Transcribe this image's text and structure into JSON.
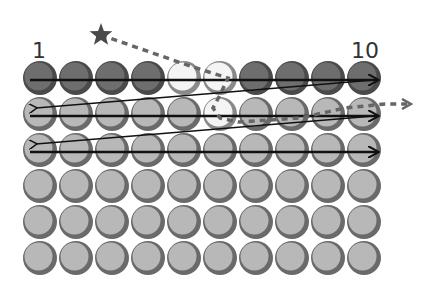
{
  "diagram": {
    "labels": {
      "start": "1",
      "end": "10"
    },
    "grid": {
      "rows": 6,
      "cols": 10,
      "origin_x": 40,
      "origin_y": 78,
      "pitch_x": 36,
      "pitch_y": 36,
      "radius": 17
    },
    "colors": {
      "dark": "#6e6e6e",
      "dark_edge": "#4a4a4a",
      "light": "#b8b8b8",
      "light_edge": "#6a6a6a",
      "white": "#f4f4f4",
      "white_edge": "#8a8a8a",
      "arrow": "#111111",
      "dashed": "#666666",
      "star": "#4a4a4a"
    },
    "row_styles": [
      "dark",
      "light",
      "light",
      "light",
      "light",
      "light"
    ],
    "highlighted_cells": [
      {
        "row": 0,
        "col": 4,
        "style": "white"
      },
      {
        "row": 0,
        "col": 5,
        "style": "white"
      },
      {
        "row": 1,
        "col": 5,
        "style": "white"
      }
    ],
    "scan_arrows": [
      {
        "type": "forward",
        "row": 0
      },
      {
        "type": "return",
        "from_row": 0,
        "to_row": 1
      },
      {
        "type": "forward",
        "row": 1
      },
      {
        "type": "return",
        "from_row": 1,
        "to_row": 2
      },
      {
        "type": "forward",
        "row": 2
      }
    ],
    "star": {
      "x": 101,
      "y": 35
    },
    "dashed_path": [
      [
        101,
        35
      ],
      [
        190,
        66
      ],
      [
        228,
        78
      ],
      [
        220,
        95
      ],
      [
        213,
        108
      ],
      [
        220,
        118
      ],
      [
        238,
        122
      ],
      [
        300,
        118
      ],
      [
        345,
        108
      ],
      [
        385,
        104
      ],
      [
        410,
        104
      ]
    ]
  }
}
